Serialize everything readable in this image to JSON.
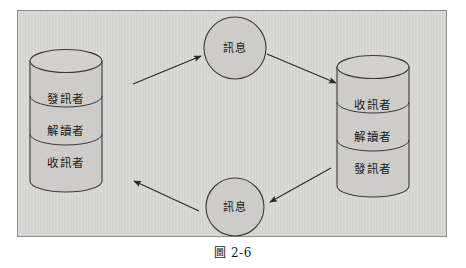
{
  "figure": {
    "caption": "圖 2-6",
    "panel": {
      "background_color": "#d5d4d2",
      "border_color": "#8d8d8b"
    },
    "stroke_color": "#3a3a38",
    "shape_fill": "#cdccc9"
  },
  "left_cylinder": {
    "name": "left-communicator-stack",
    "segments": [
      {
        "label": "發訊者"
      },
      {
        "label": "解讀者"
      },
      {
        "label": "收訊者"
      }
    ]
  },
  "right_cylinder": {
    "name": "right-communicator-stack",
    "segments": [
      {
        "label": "收訊者"
      },
      {
        "label": "解讀者"
      },
      {
        "label": "發訊者"
      }
    ]
  },
  "circles": [
    {
      "name": "top-message-node",
      "label": "訊息"
    },
    {
      "name": "bottom-message-node",
      "label": "訊息"
    }
  ],
  "arrows": [
    {
      "name": "arrow-left-to-top-message",
      "direction": "up-right"
    },
    {
      "name": "arrow-top-message-to-right",
      "direction": "down-right"
    },
    {
      "name": "arrow-right-to-bottom-message",
      "direction": "down-left"
    },
    {
      "name": "arrow-bottom-message-to-left",
      "direction": "up-left"
    }
  ]
}
